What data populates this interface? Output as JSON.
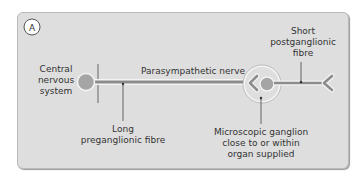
{
  "figure": {
    "panel_label": "A",
    "colors": {
      "panel_bg": "#dedede",
      "nerve": "#8c8c8c",
      "soma": "#a5a5a5",
      "ganglion_ring": "#f2f2f2",
      "text": "#333333"
    }
  },
  "labels": {
    "cns": [
      "Central",
      "nervous",
      "system"
    ],
    "nerve": "Parasympathetic nerve",
    "postganglionic": [
      "Short",
      "postganglionic",
      "fibre"
    ],
    "preganglionic": [
      "Long",
      "preganglionic fibre"
    ],
    "ganglion": [
      "Microscopic ganglion",
      "close to or within",
      "organ supplied"
    ]
  }
}
